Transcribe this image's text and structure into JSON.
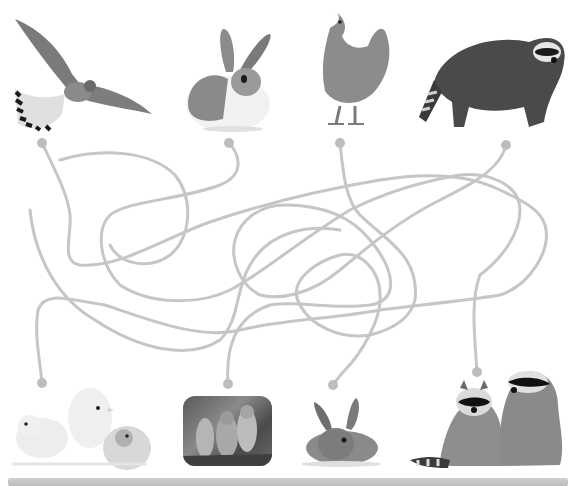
{
  "puzzle": {
    "type": "animal-parent-baby maze",
    "line_color": "#c4c4c4",
    "dot_color": "#bdbdbd"
  },
  "top_row": [
    {
      "id": "kestrel",
      "label": "Kestrel (bird)",
      "dot": [
        42,
        143
      ]
    },
    {
      "id": "rabbit",
      "label": "Rabbit",
      "dot": [
        229,
        143
      ]
    },
    {
      "id": "hen",
      "label": "Hen",
      "dot": [
        340,
        143
      ]
    },
    {
      "id": "raccoon",
      "label": "Raccoon",
      "dot": [
        506,
        145
      ]
    }
  ],
  "bottom_row": [
    {
      "id": "chicks",
      "label": "Chicks with egg",
      "dot": [
        42,
        383
      ]
    },
    {
      "id": "owlets",
      "label": "Baby birds (owlets)",
      "dot": [
        228,
        384
      ]
    },
    {
      "id": "bunny",
      "label": "Baby rabbit",
      "dot": [
        333,
        385
      ]
    },
    {
      "id": "baby-raccoons",
      "label": "Baby raccoons",
      "dot": [
        477,
        372
      ]
    }
  ]
}
